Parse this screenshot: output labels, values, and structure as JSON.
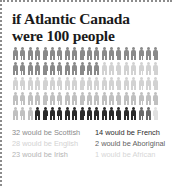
{
  "title": {
    "line1": "if Atlantic Canada",
    "line2": "were 100 people"
  },
  "colors": {
    "scottish": "#8a8a8a",
    "english": "#d2d2d2",
    "irish": "#c0c0c0",
    "french": "#2b2b2b",
    "aboriginal": "#6a6a6a",
    "african": "#e0e0e0",
    "title_text": "#1a1a1a",
    "border": "#8c8c8c",
    "background": "#ffffff"
  },
  "pictogram": {
    "total_people": 100,
    "rows": 5,
    "per_row": 20,
    "groups": [
      {
        "key": "scottish",
        "label": "Scottish",
        "count": 32,
        "color": "#8a8a8a"
      },
      {
        "key": "english",
        "label": "English",
        "count": 28,
        "color": "#d2d2d2"
      },
      {
        "key": "irish",
        "label": "Irish",
        "count": 23,
        "color": "#c0c0c0"
      },
      {
        "key": "french",
        "label": "French",
        "count": 14,
        "color": "#2b2b2b"
      },
      {
        "key": "aboriginal",
        "label": "Aboriginal",
        "count": 2,
        "color": "#6a6a6a"
      },
      {
        "key": "african",
        "label": "African",
        "count": 1,
        "color": "#e0e0e0"
      }
    ]
  },
  "legend": {
    "left_column": [
      {
        "text": "32 would be Scottish",
        "color": "#8a8a8a"
      },
      {
        "text": "28 would be English",
        "color": "#d2d2d2"
      },
      {
        "text": "23 would be Irish",
        "color": "#b4b4b4"
      }
    ],
    "right_column": [
      {
        "text": "14 would be French",
        "color": "#2b2b2b"
      },
      {
        "text": "2 would be Aboriginal",
        "color": "#5f5f5f"
      },
      {
        "text": "1 would be African",
        "color": "#d6d6d6"
      }
    ]
  },
  "chart_data": {
    "type": "pictogram",
    "title": "if Atlantic Canada were 100 people",
    "unit": "1 icon = 1 person",
    "total": 100,
    "categories": [
      "Scottish",
      "English",
      "Irish",
      "French",
      "Aboriginal",
      "African"
    ],
    "values": [
      32,
      28,
      23,
      14,
      2,
      1
    ],
    "series": [
      {
        "name": "Ancestry share per 100 people",
        "values": [
          32,
          28,
          23,
          14,
          2,
          1
        ]
      }
    ],
    "colors": [
      "#8a8a8a",
      "#d2d2d2",
      "#c0c0c0",
      "#2b2b2b",
      "#6a6a6a",
      "#e0e0e0"
    ],
    "xlabel": "",
    "ylabel": "",
    "legend_position": "bottom",
    "grid": false
  }
}
